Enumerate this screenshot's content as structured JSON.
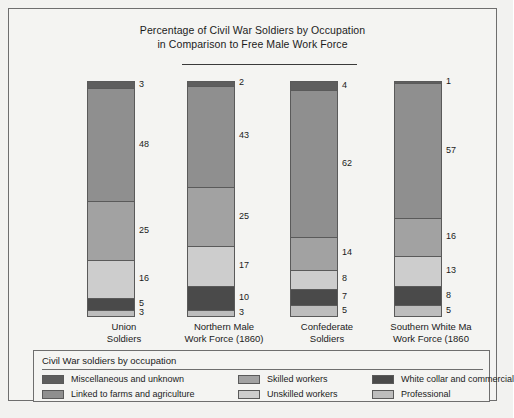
{
  "chart_data": {
    "type": "bar",
    "subtype": "stacked-percentage",
    "title": "Percentage of Civil War Soldiers by Occupation in Comparison to Free Male Work Force",
    "title_lines": [
      "Percentage of Civil War Soldiers by Occupation",
      "in Comparison to Free Male Work Force"
    ],
    "xlabel": "",
    "ylabel": "",
    "ylim": [
      0,
      100
    ],
    "grid": false,
    "legend_position": "bottom",
    "legend_title": "Civil War soldiers by occupation",
    "categories": [
      "Union Soldiers",
      "Northern Male Work Force (1860)",
      "Confederate Soldiers",
      "Southern White Ma Work Force (1860"
    ],
    "category_lines": [
      [
        "Union",
        "Soldiers"
      ],
      [
        "Northern Male",
        "Work Force (1860)"
      ],
      [
        "Confederate",
        "Soldiers"
      ],
      [
        "Southern White Ma",
        "Work Force (1860"
      ]
    ],
    "series": [
      {
        "name": "Miscellaneous and unknown",
        "color": "#5e5e5e",
        "values": [
          3,
          2,
          4,
          1
        ]
      },
      {
        "name": "Linked to farms and agriculture",
        "color": "#8f8f8f",
        "values": [
          48,
          43,
          62,
          57
        ]
      },
      {
        "name": "Skilled workers",
        "color": "#a2a2a2",
        "values": [
          25,
          25,
          14,
          16
        ]
      },
      {
        "name": "Unskilled workers",
        "color": "#cdcdcd",
        "values": [
          16,
          17,
          8,
          13
        ]
      },
      {
        "name": "White collar and commercial",
        "color": "#4a4a4a",
        "values": [
          5,
          10,
          7,
          8
        ]
      },
      {
        "name": "Professional",
        "color": "#bdbdbd",
        "values": [
          3,
          3,
          5,
          5
        ]
      }
    ]
  },
  "legend": {
    "title": "Civil War soldiers by occupation",
    "items": [
      {
        "label": "Miscellaneous and unknown",
        "color": "#5e5e5e"
      },
      {
        "label": "Linked to farms and agriculture",
        "color": "#8f8f8f"
      },
      {
        "label": "Skilled workers",
        "color": "#a2a2a2"
      },
      {
        "label": "Unskilled workers",
        "color": "#cdcdcd"
      },
      {
        "label": "White collar and commercial",
        "color": "#4a4a4a"
      },
      {
        "label": "Professional",
        "color": "#bdbdbd"
      }
    ]
  }
}
